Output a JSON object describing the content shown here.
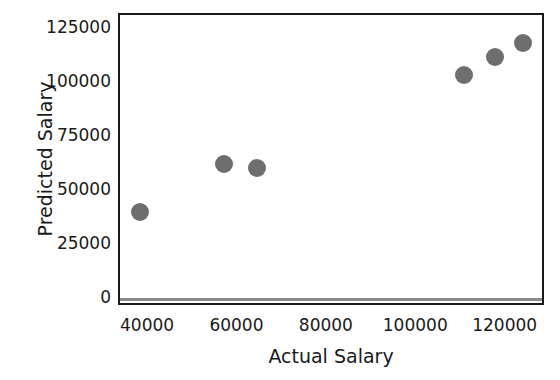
{
  "chart_data": {
    "type": "scatter",
    "title": "",
    "xlabel": "Actual Salary",
    "ylabel": "Predicted Salary",
    "xlim": [
      33500,
      128800
    ],
    "ylim": [
      -3900,
      131500
    ],
    "xticks": [
      40000,
      60000,
      80000,
      100000,
      120000
    ],
    "xtick_labels": [
      "40000",
      "60000",
      "80000",
      "100000",
      "120000"
    ],
    "yticks": [
      0,
      25000,
      50000,
      75000,
      100000,
      125000
    ],
    "ytick_labels": [
      "0",
      "25000",
      "50000",
      "75000",
      "100000",
      "125000"
    ],
    "grid": false,
    "legend": null,
    "marker_color": "#6e6e6e",
    "marker_size_px": 18,
    "reference_line": {
      "orientation": "horizontal",
      "y": 0,
      "color": "#8a8a8a"
    },
    "points": [
      {
        "x": 38000,
        "y": 40300
      },
      {
        "x": 56800,
        "y": 62500
      },
      {
        "x": 64100,
        "y": 60700
      },
      {
        "x": 110400,
        "y": 103700
      },
      {
        "x": 117300,
        "y": 112000
      },
      {
        "x": 123600,
        "y": 118500
      }
    ]
  }
}
